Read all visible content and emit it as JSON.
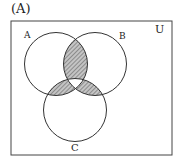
{
  "figure": {
    "label": "(A)",
    "universe_label": "U",
    "sets": [
      {
        "name": "A",
        "label": "A"
      },
      {
        "name": "B",
        "label": "B"
      },
      {
        "name": "C",
        "label": "C"
      }
    ],
    "shaded_regions": [
      "A∩B∖C",
      "A∩C∖B",
      "B∩C∖A"
    ],
    "unshaded_regions": [
      "A∩B∩C",
      "A only",
      "B only",
      "C only",
      "outside"
    ],
    "colors": {
      "stroke": "#333333",
      "shade_fill": "#bdbdbd",
      "hatch": "#555555"
    }
  }
}
